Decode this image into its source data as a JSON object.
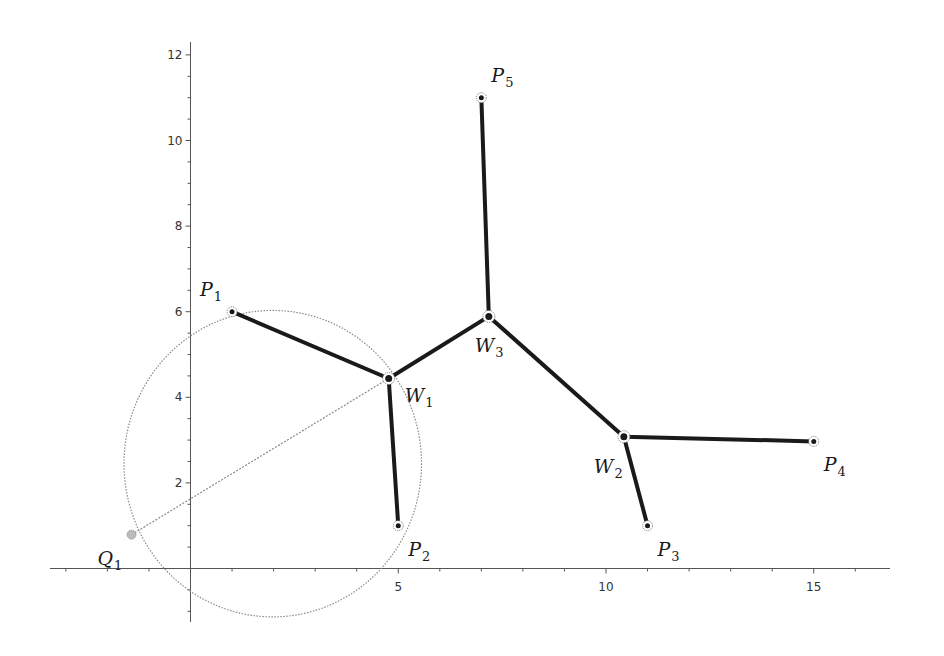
{
  "figure": {
    "title": ""
  },
  "axes": {
    "x_ticks": [
      {
        "value": 5,
        "label": "5"
      },
      {
        "value": 10,
        "label": "10"
      },
      {
        "value": 15,
        "label": "15"
      }
    ],
    "y_ticks": [
      {
        "value": 2,
        "label": "2"
      },
      {
        "value": 4,
        "label": "4"
      },
      {
        "value": 6,
        "label": "6"
      },
      {
        "value": 8,
        "label": "8"
      },
      {
        "value": 10,
        "label": "10"
      },
      {
        "value": 12,
        "label": "12"
      }
    ],
    "x_range": [
      -3.4,
      17
    ],
    "y_range": [
      -1.3,
      12.4
    ],
    "minor_x_step": 1,
    "minor_y_step": 0.5
  },
  "points": [
    {
      "id": "P1",
      "base": "P",
      "sub": "1",
      "x": 1.0,
      "y": 6.0,
      "type": "terminal",
      "label_dx": -32,
      "label_dy": -16
    },
    {
      "id": "P2",
      "base": "P",
      "sub": "2",
      "x": 5.0,
      "y": 1.0,
      "type": "terminal",
      "label_dx": 10,
      "label_dy": 30
    },
    {
      "id": "P3",
      "base": "P",
      "sub": "3",
      "x": 11.0,
      "y": 1.0,
      "type": "terminal",
      "label_dx": 10,
      "label_dy": 30
    },
    {
      "id": "P4",
      "base": "P",
      "sub": "4",
      "x": 15.0,
      "y": 2.97,
      "type": "terminal",
      "label_dx": 10,
      "label_dy": 30
    },
    {
      "id": "P5",
      "base": "P",
      "sub": "5",
      "x": 7.0,
      "y": 11.0,
      "type": "terminal",
      "label_dx": 10,
      "label_dy": -16
    },
    {
      "id": "W1",
      "base": "W",
      "sub": "1",
      "x": 4.77,
      "y": 4.44,
      "type": "steiner",
      "label_dx": 16,
      "label_dy": 24
    },
    {
      "id": "W2",
      "base": "W",
      "sub": "2",
      "x": 10.43,
      "y": 3.08,
      "type": "steiner",
      "label_dx": -30,
      "label_dy": 36
    },
    {
      "id": "W3",
      "base": "W",
      "sub": "3",
      "x": 7.18,
      "y": 5.89,
      "type": "steiner",
      "label_dx": -14,
      "label_dy": 36
    },
    {
      "id": "Q1",
      "base": "Q",
      "sub": "1",
      "x": -1.42,
      "y": 0.79,
      "type": "auxiliary",
      "label_dx": -34,
      "label_dy": 30
    }
  ],
  "edges": [
    {
      "from": "P1",
      "to": "W1"
    },
    {
      "from": "W1",
      "to": "P2"
    },
    {
      "from": "W1",
      "to": "W3"
    },
    {
      "from": "W3",
      "to": "P5"
    },
    {
      "from": "W3",
      "to": "W2"
    },
    {
      "from": "W2",
      "to": "P4"
    },
    {
      "from": "W2",
      "to": "P3"
    }
  ],
  "construction": {
    "circle": {
      "cx": 1.98,
      "cy": 2.45,
      "r": 3.58
    },
    "line": {
      "from": "Q1",
      "to": "W1"
    }
  },
  "chart_data": {
    "type": "scatter",
    "title": "",
    "xlabel": "",
    "ylabel": "",
    "xlim": [
      -3.4,
      17
    ],
    "ylim": [
      -1.3,
      12.4
    ],
    "grid": false,
    "x_tick_labels": [
      "5",
      "10",
      "15"
    ],
    "y_tick_labels": [
      "2",
      "4",
      "6",
      "8",
      "10",
      "12"
    ],
    "series": [
      {
        "name": "terminals",
        "points": [
          {
            "label": "P1",
            "x": 1.0,
            "y": 6.0
          },
          {
            "label": "P2",
            "x": 5.0,
            "y": 1.0
          },
          {
            "label": "P3",
            "x": 11.0,
            "y": 1.0
          },
          {
            "label": "P4",
            "x": 15.0,
            "y": 2.97
          },
          {
            "label": "P5",
            "x": 7.0,
            "y": 11.0
          }
        ]
      },
      {
        "name": "steiner_points",
        "points": [
          {
            "label": "W1",
            "x": 4.77,
            "y": 4.44
          },
          {
            "label": "W2",
            "x": 10.43,
            "y": 3.08
          },
          {
            "label": "W3",
            "x": 7.18,
            "y": 5.89
          }
        ]
      },
      {
        "name": "auxiliary",
        "points": [
          {
            "label": "Q1",
            "x": -1.42,
            "y": 0.79
          }
        ]
      }
    ],
    "segments": [
      [
        "P1",
        "W1"
      ],
      [
        "W1",
        "P2"
      ],
      [
        "W1",
        "W3"
      ],
      [
        "W3",
        "P5"
      ],
      [
        "W3",
        "W2"
      ],
      [
        "W2",
        "P4"
      ],
      [
        "W2",
        "P3"
      ]
    ],
    "annotations": [
      {
        "type": "dotted-circle",
        "center": [
          1.98,
          2.45
        ],
        "radius": 3.58
      },
      {
        "type": "dotted-line",
        "from": [
          -1.42,
          0.79
        ],
        "to": [
          4.77,
          4.44
        ]
      }
    ]
  }
}
